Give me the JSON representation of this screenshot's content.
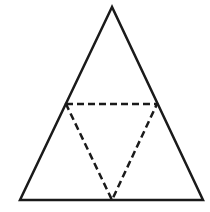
{
  "diagram": {
    "type": "geometry",
    "colors": {
      "background": "#ffffff",
      "stroke": "#1a1a1a"
    },
    "outer_triangle": {
      "style": "solid",
      "stroke_width": 2.5,
      "vertices": [
        {
          "name": "apex",
          "x": 112,
          "y": 7
        },
        {
          "name": "bottom-left",
          "x": 20,
          "y": 200
        },
        {
          "name": "bottom-right",
          "x": 203,
          "y": 200
        }
      ]
    },
    "inner_triangle": {
      "style": "dashed",
      "stroke_width": 2.5,
      "dash": "7,4",
      "vertices": [
        {
          "name": "left-midpoint",
          "x": 66,
          "y": 104
        },
        {
          "name": "right-midpoint",
          "x": 157,
          "y": 104
        },
        {
          "name": "bottom-midpoint",
          "x": 112,
          "y": 200
        }
      ]
    }
  }
}
